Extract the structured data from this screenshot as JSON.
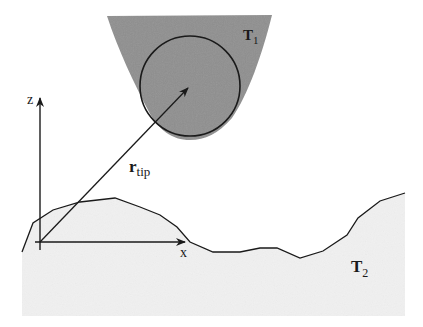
{
  "diagram": {
    "type": "schematic",
    "labels": {
      "tip_body": "T",
      "tip_body_sub": "1",
      "surface_body": "T",
      "surface_body_sub": "2",
      "vector": "r",
      "vector_sub": "tip",
      "axis_z": "z",
      "axis_x": "x"
    },
    "colors": {
      "tip_fill": "#8f8f8f",
      "surface_fill": "#f1f1f1",
      "line": "#1a1a1a",
      "background": "#ffffff"
    }
  }
}
